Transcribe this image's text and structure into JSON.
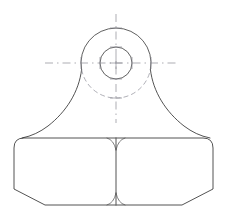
{
  "drawing": {
    "title": "Mechanical part orthographic outline",
    "view": "front-view",
    "background_color": "#ffffff",
    "line_color": "#1a1a1a",
    "centerline_color": "#8a8a93",
    "hidden_line_color": "#8d8d97",
    "canvas": {
      "width": 226,
      "height": 214
    },
    "boss": {
      "name": "circular-boss",
      "center": {
        "x": 116,
        "y": 63
      },
      "outer_radius": 35,
      "inner_radius": 16,
      "inner_name": "bore-hole",
      "outer_name": "boss-outer-circle"
    },
    "body": {
      "name": "base-block",
      "left": 14,
      "right": 213,
      "top": 138,
      "bottom": 205,
      "top_corner_radius": 10,
      "bottom_chamfer": 31
    },
    "flanks": {
      "name": "fillet-flanks",
      "left_tangent": {
        "x": 81,
        "y": 68
      },
      "right_tangent": {
        "x": 151,
        "y": 68
      },
      "shoulder_y": 138
    },
    "center_divider": {
      "name": "vertical-parting-line",
      "x": 116,
      "top": 138,
      "bottom": 205,
      "cusp_radius": 9
    },
    "centerlines": {
      "horizontal": {
        "y": 63,
        "x1": 45,
        "x2": 176
      },
      "vertical": {
        "x": 116,
        "y1": 14,
        "y2": 123
      }
    },
    "labels": {
      "dimensions_shown": "none",
      "annotations": "none"
    }
  }
}
